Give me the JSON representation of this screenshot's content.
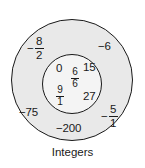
{
  "diagram": {
    "type": "nested-set-diagram",
    "caption": "Integers",
    "outer_region": {
      "name": "Integers",
      "fill_color": "#e9e9e9",
      "stroke_color": "#1a1a1a",
      "members": [
        {
          "id": "neg-eight-halves",
          "kind": "fraction",
          "sign": "−",
          "numerator": "8",
          "denominator": "2",
          "text": "−8/2"
        },
        {
          "id": "neg-six",
          "kind": "integer",
          "text": "−6"
        },
        {
          "id": "neg-seventy-five",
          "kind": "integer",
          "text": "−75"
        },
        {
          "id": "neg-five-over-one",
          "kind": "fraction",
          "sign": "−",
          "numerator": "5",
          "denominator": "1",
          "text": "−5/1"
        },
        {
          "id": "neg-two-hundred",
          "kind": "integer",
          "text": "−200"
        }
      ]
    },
    "inner_region": {
      "name": "",
      "fill_color": "#f4f4f4",
      "stroke_color": "#1a1a1a",
      "members": [
        {
          "id": "zero",
          "kind": "integer",
          "text": "0"
        },
        {
          "id": "six-sixths",
          "kind": "fraction",
          "sign": "",
          "numerator": "6",
          "denominator": "6",
          "text": "6/6"
        },
        {
          "id": "fifteen",
          "kind": "integer",
          "text": "15"
        },
        {
          "id": "nine-over-one",
          "kind": "fraction",
          "sign": "",
          "numerator": "9",
          "denominator": "1",
          "text": "9/1"
        },
        {
          "id": "twenty-seven",
          "kind": "integer",
          "text": "27"
        }
      ]
    }
  }
}
